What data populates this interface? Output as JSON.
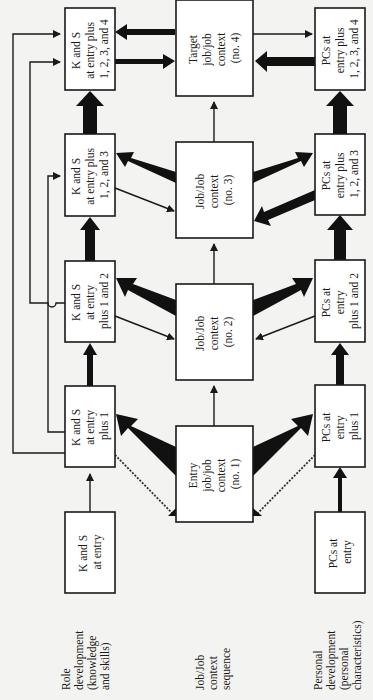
{
  "diagram": {
    "orientation": "rotated 90 degrees counter-clockwise",
    "row_labels": {
      "role": [
        "Role",
        "development",
        "(knowledge",
        "and skills)"
      ],
      "job": [
        "Job/Job",
        "context",
        "sequence"
      ],
      "personal": [
        "Personal",
        "development",
        "(personal",
        "characteristics)"
      ]
    },
    "role_boxes": [
      {
        "id": "ks0",
        "lines": [
          "K and S",
          "at entry"
        ]
      },
      {
        "id": "ks1",
        "lines": [
          "K and S",
          "at entry",
          "plus 1"
        ]
      },
      {
        "id": "ks2",
        "lines": [
          "K and S",
          "at entry",
          "plus 1 and 2"
        ]
      },
      {
        "id": "ks3",
        "lines": [
          "K and S",
          "at entry plus",
          "1, 2, and 3"
        ]
      },
      {
        "id": "ks4",
        "lines": [
          "K and S",
          "at entry plus",
          "1, 2, 3, and 4"
        ]
      }
    ],
    "job_boxes": [
      {
        "id": "job1",
        "lines": [
          "Entry",
          "job/job",
          "context",
          "(no. 1)"
        ]
      },
      {
        "id": "job2",
        "lines": [
          "Job/Job",
          "context",
          "(no. 2)"
        ]
      },
      {
        "id": "job3",
        "lines": [
          "Job/Job",
          "context",
          "(no. 3)"
        ]
      },
      {
        "id": "job4",
        "lines": [
          "Target",
          "job/job",
          "context",
          "(no. 4)"
        ]
      }
    ],
    "personal_boxes": [
      {
        "id": "pc0",
        "lines": [
          "PCs at",
          "entry"
        ]
      },
      {
        "id": "pc1",
        "lines": [
          "PCs at",
          "entry",
          "plus 1"
        ]
      },
      {
        "id": "pc2",
        "lines": [
          "PCs at",
          "entry",
          "plus 1 and 2"
        ]
      },
      {
        "id": "pc3",
        "lines": [
          "PCs at",
          "entry plus",
          "1, 2, and 3"
        ]
      },
      {
        "id": "pc4",
        "lines": [
          "PCs at",
          "entry plus",
          "1, 2, 3, and 4"
        ]
      }
    ],
    "colors": {
      "background": "#f3f3f1",
      "box_fill": "#ffffff",
      "ink": "#1a1a1a"
    }
  }
}
